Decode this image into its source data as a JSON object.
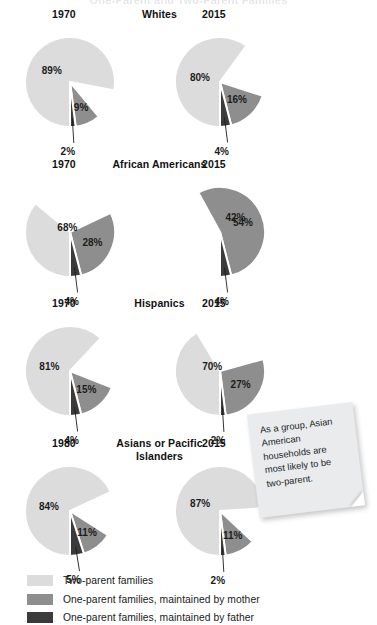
{
  "page": {
    "cut_title": "One-Parent and Two-Parent Families"
  },
  "note": {
    "text": "As a group, Asian American households are most likely to be two-parent."
  },
  "legend": {
    "items": [
      {
        "label": "Two-parent families",
        "color": "#dcdcdc",
        "key": "two_parent"
      },
      {
        "label": "One-parent families, maintained by mother",
        "color": "#8e8e8e",
        "key": "mother"
      },
      {
        "label": "One-parent families, maintained by father",
        "color": "#3b3b3b",
        "key": "father"
      }
    ]
  },
  "colors": {
    "two_parent": "#dcdcdc",
    "mother": "#8e8e8e",
    "father": "#3b3b3b",
    "gap": "#ffffff",
    "text": "#1a1a1a"
  },
  "chart_data": {
    "type": "pie",
    "title": "One-Parent and Two-Parent Families",
    "legend_position": "bottom",
    "series_names": [
      "Two-parent families",
      "One-parent families, maintained by mother",
      "One-parent families, maintained by father"
    ],
    "groups": [
      {
        "name": "Whites",
        "charts": [
          {
            "year": "1970",
            "labels": [
              "89%",
              "9%",
              "2%"
            ],
            "values": [
              89,
              9,
              2
            ]
          },
          {
            "year": "2015",
            "labels": [
              "80%",
              "16%",
              "4%"
            ],
            "values": [
              80,
              16,
              4
            ]
          }
        ]
      },
      {
        "name": "African Americans",
        "charts": [
          {
            "year": "1970",
            "labels": [
              "68%",
              "28%",
              "4%"
            ],
            "values": [
              68,
              28,
              4
            ]
          },
          {
            "year": "2015",
            "labels": [
              "42%",
              "54%",
              "4%"
            ],
            "values": [
              42,
              54,
              4
            ]
          }
        ]
      },
      {
        "name": "Hispanics",
        "charts": [
          {
            "year": "1970",
            "labels": [
              "81%",
              "15%",
              "4%"
            ],
            "values": [
              81,
              15,
              4
            ]
          },
          {
            "year": "2015",
            "labels": [
              "70%",
              "27%",
              "2%"
            ],
            "values": [
              70,
              27,
              2
            ]
          }
        ]
      },
      {
        "name": "Asians or Pacific Islanders",
        "charts": [
          {
            "year": "1980",
            "labels": [
              "84%",
              "11%",
              "5%"
            ],
            "values": [
              84,
              11,
              5
            ]
          },
          {
            "year": "2015",
            "labels": [
              "87%",
              "11%",
              "2%"
            ],
            "values": [
              87,
              11,
              2
            ]
          }
        ]
      }
    ]
  }
}
